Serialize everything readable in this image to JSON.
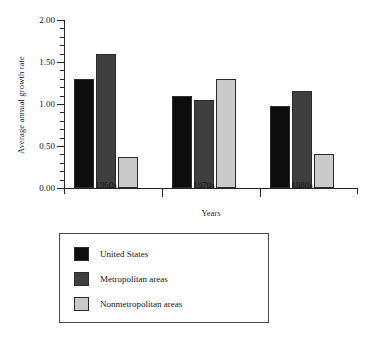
{
  "chart_data": {
    "type": "bar",
    "title": "",
    "xlabel": "Years",
    "ylabel": "Average annual growth rate",
    "categories": [
      "1960s",
      "1970s",
      "1980s"
    ],
    "series": [
      {
        "name": "United States",
        "color": "#0d0d0d",
        "values": [
          1.3,
          1.1,
          0.98
        ]
      },
      {
        "name": "Metropolitan areas",
        "color": "#3f3f3f",
        "values": [
          1.6,
          1.05,
          1.16
        ]
      },
      {
        "name": "Nonmetropolitan areas",
        "color": "#cacaca",
        "values": [
          0.37,
          1.3,
          0.41
        ]
      }
    ],
    "ylim": [
      0.0,
      2.0
    ],
    "ytick_major_step": 0.5,
    "ytick_minor_step": 0.1,
    "ytick_labels": [
      "0.00",
      "0.50",
      "1.00",
      "1.50",
      "2.00"
    ],
    "ytick_values": [
      0.0,
      0.5,
      1.0,
      1.5,
      2.0
    ],
    "grid": false,
    "legend_position": "below-left"
  },
  "axes": {
    "y_title": "Average annual growth rate",
    "x_title": "Years"
  },
  "legend": {
    "entries": [
      {
        "label": "United States"
      },
      {
        "label": "Metropolitan areas"
      },
      {
        "label": "Nonmetropolitan areas"
      }
    ]
  }
}
